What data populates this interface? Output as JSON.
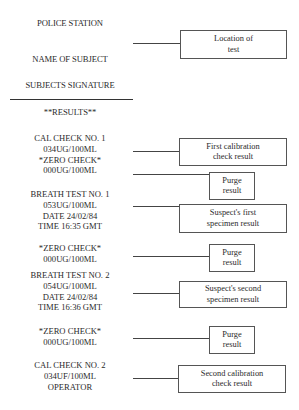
{
  "header": {
    "police_station": "POLICE STATION",
    "name_of_subject": "NAME OF SUBJECT",
    "subjects_signature": "SUBJECTS SIGNATURE",
    "results": "**RESULTS**"
  },
  "printout": {
    "cal_check_1": [
      "CAL CHECK NO. 1",
      "034UG/100ML",
      "*ZERO CHECK*",
      "000UG/100ML"
    ],
    "breath_test_1": [
      "BREATH TEST NO. 1",
      "053UG/100ML",
      "DATE 24/02/84",
      "TIME 16:35 GMT"
    ],
    "zero_check_2": [
      "*ZERO CHECK*",
      "000UG/100ML"
    ],
    "breath_test_2": [
      "BREATH TEST NO. 2",
      "054UG/100ML",
      "DATE 24/02/84",
      "TIME 16:36 GMT"
    ],
    "zero_check_3": [
      "*ZERO CHECK*",
      "000UG/100ML"
    ],
    "cal_check_2": [
      "CAL CHECK NO. 2",
      "034UF/100ML",
      "OPERATOR"
    ]
  },
  "annotations": {
    "location": [
      "Location of",
      "test"
    ],
    "first_calibration": [
      "First calibration",
      "check result"
    ],
    "purge_1": [
      "Purge",
      "result"
    ],
    "suspect_first": [
      "Suspect's first",
      "specimen result"
    ],
    "purge_2": [
      "Purge",
      "result"
    ],
    "suspect_second": [
      "Suspect's second",
      "specimen result"
    ],
    "purge_3": [
      "Purge",
      "result"
    ],
    "second_calibration": [
      "Second calibration",
      "check result"
    ]
  }
}
